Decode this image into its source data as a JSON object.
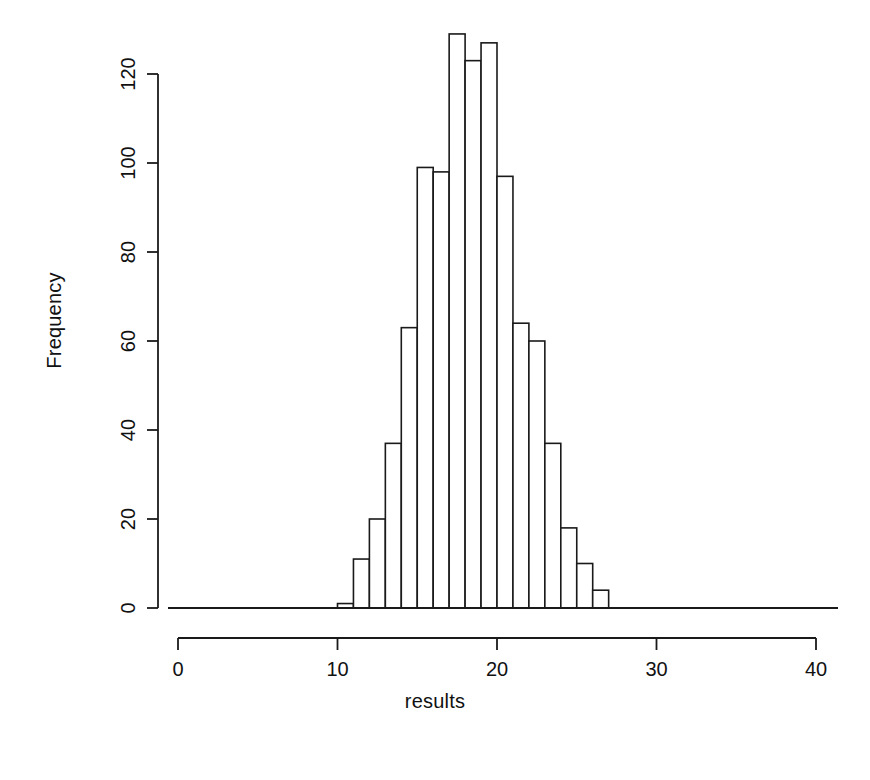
{
  "chart_data": {
    "type": "bar",
    "title": "",
    "subtitle": "",
    "xlabel": "results",
    "ylabel": "Frequency",
    "xlim": [
      0,
      40
    ],
    "ylim": [
      0,
      130
    ],
    "grid": false,
    "legend": null,
    "bin_width": 1,
    "bin_starts": [
      10,
      11,
      12,
      13,
      14,
      15,
      16,
      17,
      18,
      19,
      20,
      21,
      22,
      23,
      24,
      25,
      26,
      27
    ],
    "categories": [
      "10-11",
      "11-12",
      "12-13",
      "13-14",
      "14-15",
      "15-16",
      "16-17",
      "17-18",
      "18-19",
      "19-20",
      "20-21",
      "21-22",
      "22-23",
      "23-24",
      "24-25",
      "25-26",
      "26-27",
      "27-28"
    ],
    "values": [
      1,
      11,
      20,
      37,
      63,
      99,
      98,
      129,
      123,
      127,
      97,
      64,
      60,
      37,
      18,
      10,
      4,
      0
    ],
    "x_ticks": [
      0,
      10,
      20,
      30,
      40
    ],
    "x_tick_labels": [
      "0",
      "10",
      "20",
      "30",
      "40"
    ],
    "y_ticks": [
      0,
      20,
      40,
      60,
      80,
      100,
      120
    ],
    "y_tick_labels": [
      "0",
      "20",
      "40",
      "60",
      "80",
      "100",
      "120"
    ],
    "bar_fill": "#ffffff",
    "bar_stroke": "#1a1a1a",
    "axis_color": "#1a1a1a",
    "background": "#ffffff"
  },
  "axes": {
    "y_title": "Frequency",
    "x_title": "results"
  }
}
